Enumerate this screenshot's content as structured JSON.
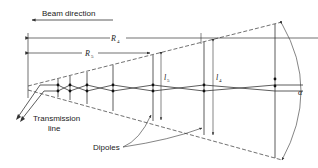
{
  "diagram": {
    "beam_direction": {
      "label": "Beam direction"
    },
    "dimensions": {
      "R4": {
        "symbol": "R",
        "subscript": "4"
      },
      "R5": {
        "symbol": "R",
        "subscript": "5"
      },
      "l5": {
        "symbol": "l",
        "subscript": "5"
      },
      "l4": {
        "symbol": "l",
        "subscript": "4"
      },
      "alpha": {
        "symbol": "α"
      }
    },
    "labels": {
      "transmission_line_1": "Transmission",
      "transmission_line_2": "line",
      "dipoles": "Dipoles"
    },
    "colors": {
      "line": "#333333",
      "background": "#ffffff"
    }
  }
}
